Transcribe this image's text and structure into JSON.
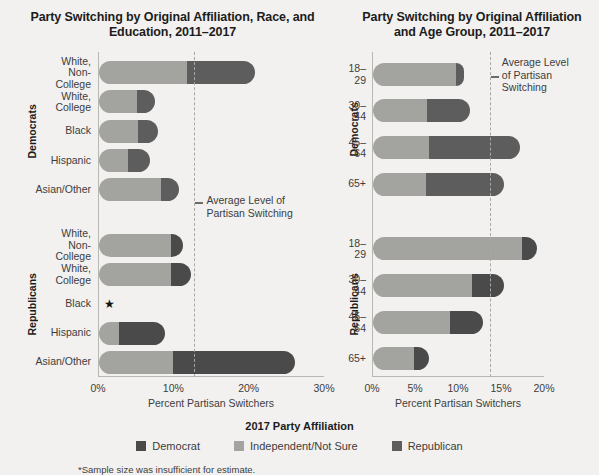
{
  "colors": {
    "background": "#f2f1ef",
    "democrat": "#4a4a4a",
    "independent": "#a3a3a0",
    "republican": "#5d5d5d",
    "axis": "#b9b7b3",
    "avg_line": "#a9a7a3"
  },
  "legend": {
    "title": "2017 Party Affiliation",
    "items": [
      {
        "label": "Democrat",
        "color": "#4a4a4a",
        "key": "democrat"
      },
      {
        "label": "Independent/Not Sure",
        "color": "#a3a3a0",
        "key": "independent"
      },
      {
        "label": "Republican",
        "color": "#5d5d5d",
        "key": "republican"
      }
    ]
  },
  "footnote": "*Sample size was insufficient for estimate.",
  "chart_data": [
    {
      "id": "left",
      "type": "bar",
      "orientation": "horizontal",
      "stacked": true,
      "title": "Party Switching by Original Affiliation,\nRace, and Education, 2011–2017",
      "xlabel": "Percent Partisan Switchers",
      "ylabel": "",
      "xlim": [
        0,
        30
      ],
      "xticks": [
        0,
        10,
        20,
        30
      ],
      "xticklabels": [
        "0%",
        "10%",
        "20%",
        "30%"
      ],
      "grid": false,
      "annotation": {
        "text": "Average Level of\nPartisan Switching",
        "value": 12.8,
        "label": "Average Level of Partisan Switching"
      },
      "groups": [
        {
          "name": "Democrats",
          "categories": [
            "White,\nNon-College",
            "White, College",
            "Black",
            "Hispanic",
            "Asian/Other"
          ],
          "series": [
            {
              "name": "Independent/Not Sure",
              "key": "independent",
              "values": [
                11.7,
                5.0,
                5.2,
                3.9,
                8.2
              ]
            },
            {
              "name": "Republican",
              "key": "republican",
              "values": [
                9.0,
                2.4,
                2.6,
                2.9,
                2.4
              ]
            }
          ],
          "totals": [
            20.7,
            7.4,
            7.8,
            6.8,
            10.6
          ]
        },
        {
          "name": "Republicans",
          "categories": [
            "White,\nNon-College",
            "White, College",
            "Black",
            "Hispanic",
            "Asian/Other"
          ],
          "series": [
            {
              "name": "Independent/Not Sure",
              "key": "independent",
              "values": [
                9.5,
                9.6,
                null,
                2.7,
                9.8
              ]
            },
            {
              "name": "Democrat",
              "key": "democrat",
              "values": [
                1.6,
                2.6,
                null,
                6.0,
                16.2
              ]
            }
          ],
          "totals": [
            11.1,
            12.2,
            null,
            8.7,
            26.0
          ],
          "insufficient_marker": {
            "category": "Black",
            "glyph": "★"
          }
        }
      ]
    },
    {
      "id": "right",
      "type": "bar",
      "orientation": "horizontal",
      "stacked": true,
      "title": "Party Switching by Original Affiliation\nand Age Group, 2011–2017",
      "xlabel": "Percent Partisan Switchers",
      "ylabel": "",
      "xlim": [
        0,
        20
      ],
      "xticks": [
        0,
        5,
        10,
        15,
        20
      ],
      "xticklabels": [
        "0%",
        "5%",
        "10%",
        "15%",
        "20%"
      ],
      "grid": false,
      "annotation": {
        "text": "Average Level\nof Partisan\nSwitching",
        "value": 13.7,
        "label": "Average Level of Partisan Switching"
      },
      "groups": [
        {
          "name": "Democrats",
          "categories": [
            "18–29",
            "30–44",
            "45–64",
            "65+"
          ],
          "series": [
            {
              "name": "Independent/Not Sure",
              "key": "independent",
              "values": [
                9.6,
                6.3,
                6.5,
                6.2
              ]
            },
            {
              "name": "Republican",
              "key": "republican",
              "values": [
                1.0,
                5.0,
                10.6,
                9.0
              ]
            }
          ],
          "totals": [
            10.6,
            11.3,
            17.1,
            15.2
          ]
        },
        {
          "name": "Republicans",
          "categories": [
            "18–29",
            "30–44",
            "45–64",
            "65+"
          ],
          "series": [
            {
              "name": "Independent/Not Sure",
              "key": "independent",
              "values": [
                17.3,
                11.5,
                8.9,
                4.8
              ]
            },
            {
              "name": "Democrat",
              "key": "democrat",
              "values": [
                1.8,
                3.7,
                3.9,
                1.7
              ]
            }
          ],
          "totals": [
            19.1,
            15.2,
            12.8,
            6.5
          ]
        }
      ]
    }
  ]
}
